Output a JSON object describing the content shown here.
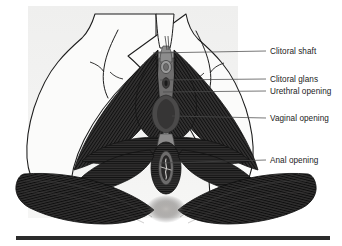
{
  "figure": {
    "view": "inferior perineal view",
    "background_color": "#ffffff",
    "shade_panel_color": "#f1f1f0",
    "skin_fill_color": "#fbfbfa",
    "muscle_dark_color": "#2e2d2d",
    "muscle_mid_color": "#3c3b3b",
    "tissue_grey_color": "#8e8e8e",
    "tissue_light_grey_color": "#a9a9a9",
    "outline_color": "#1c1c1c",
    "leader_line_color": "#4a4a4a",
    "baseline_bar_color": "#2b2b2b"
  },
  "labels": [
    {
      "id": "clitoral-shaft",
      "text": "Clitoral shaft",
      "text_x": 270,
      "text_y": 47,
      "leader": {
        "x1": 153,
        "y1": 53,
        "x2": 266,
        "y2": 51
      }
    },
    {
      "id": "clitoral-glans",
      "text": "Clitoral glans",
      "text_x": 270,
      "text_y": 75,
      "leader": {
        "x1": 160,
        "y1": 80,
        "x2": 266,
        "y2": 79
      }
    },
    {
      "id": "urethral-opening",
      "text": "Urethral opening",
      "text_x": 270,
      "text_y": 87,
      "leader": {
        "x1": 163,
        "y1": 92,
        "x2": 266,
        "y2": 91
      }
    },
    {
      "id": "vaginal-opening",
      "text": "Vaginal opening",
      "text_x": 270,
      "text_y": 114,
      "leader": {
        "x1": 172,
        "y1": 116,
        "x2": 266,
        "y2": 118
      }
    },
    {
      "id": "anal-opening",
      "text": "Anal opening",
      "text_x": 270,
      "text_y": 156,
      "leader": {
        "x1": 160,
        "y1": 163,
        "x2": 266,
        "y2": 160
      }
    }
  ],
  "structures": [
    {
      "id": "labia-outline",
      "name": "labial and thigh skin outline"
    },
    {
      "id": "ischiocavernosus-left",
      "name": "left ischiocavernosus muscle"
    },
    {
      "id": "ischiocavernosus-right",
      "name": "right ischiocavernosus muscle"
    },
    {
      "id": "bulbospongiosus-left",
      "name": "left bulbospongiosus muscle"
    },
    {
      "id": "bulbospongiosus-right",
      "name": "right bulbospongiosus muscle"
    },
    {
      "id": "superficial-transverse-perineal",
      "name": "superficial transverse perineal muscle"
    },
    {
      "id": "external-anal-sphincter",
      "name": "external anal sphincter"
    },
    {
      "id": "gluteus-maximus-left",
      "name": "left gluteus maximus"
    },
    {
      "id": "gluteus-maximus-right",
      "name": "right gluteus maximus"
    },
    {
      "id": "perineal-body",
      "name": "perineal body"
    },
    {
      "id": "vestibule",
      "name": "vestibule"
    }
  ],
  "baseline_bar": {
    "x": 16,
    "y": 236,
    "width": 314,
    "height": 4
  }
}
